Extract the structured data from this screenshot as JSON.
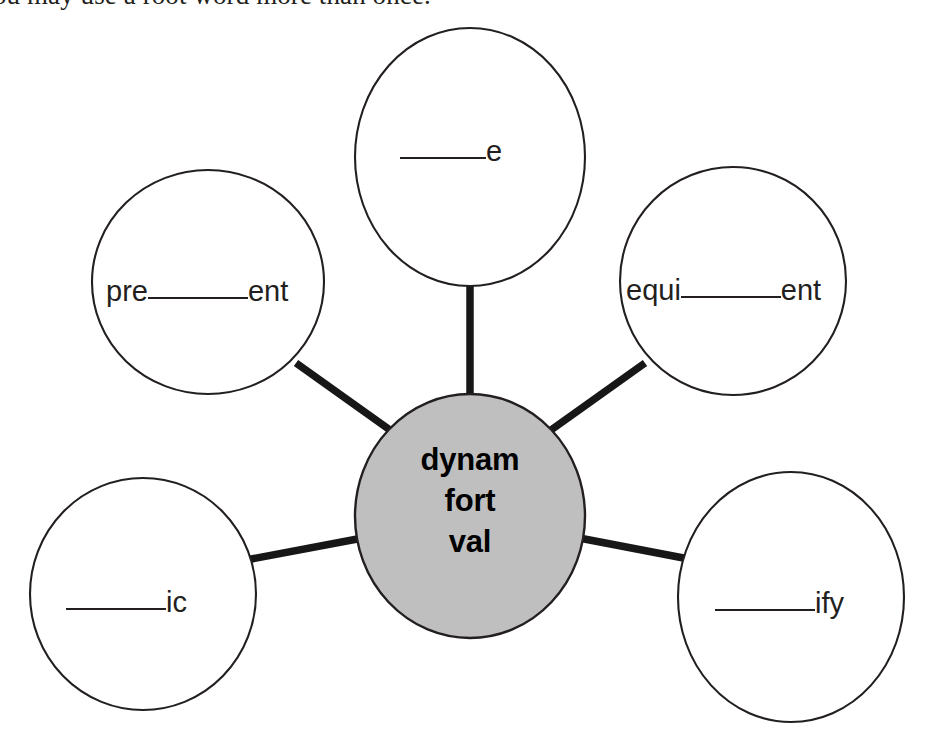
{
  "instruction": {
    "text": "You may use a root word more than once."
  },
  "diagram": {
    "type": "word-web",
    "center": {
      "name": "root-words",
      "lines": [
        "dynam",
        "fort",
        "val"
      ],
      "fill_color": "#bfbfbf",
      "stroke_color": "#231f20"
    },
    "nodes": [
      {
        "id": "top",
        "position": "top",
        "prefix": "",
        "blank": "______",
        "suffix": "e",
        "answer_slot": true
      },
      {
        "id": "upper-left",
        "position": "upper-left",
        "prefix": "pre",
        "blank": "______",
        "suffix": "ent",
        "answer_slot": true
      },
      {
        "id": "upper-right",
        "position": "upper-right",
        "prefix": "equi",
        "blank": "______",
        "suffix": "ent",
        "answer_slot": true
      },
      {
        "id": "lower-left",
        "position": "lower-left",
        "prefix": "",
        "blank": "______",
        "suffix": "ic",
        "answer_slot": true
      },
      {
        "id": "lower-right",
        "position": "lower-right",
        "prefix": "",
        "blank": "______",
        "suffix": "ify",
        "answer_slot": true
      }
    ],
    "connector_color": "#171717"
  }
}
